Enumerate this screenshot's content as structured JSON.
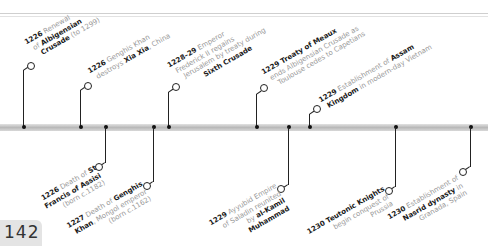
{
  "page": {
    "number": "142"
  },
  "colors": {
    "bar": "#c4c4c4",
    "connector": "#222222",
    "year_text": "#1a1a1a",
    "body_text": "#9a9a9a",
    "page_tab": "#e4e4e4"
  },
  "events_above": [
    {
      "year": "1226",
      "pre": " Renewal",
      "l2_pre": "of ",
      "bold": "Albigensian",
      "l3_bold": "Crusade",
      "l3": " (to 1299)"
    },
    {
      "year": "1226",
      "pre": " Genghis Khan",
      "l2_pre": "destroys ",
      "bold": "Xia Xia",
      "l2_post": ", China"
    },
    {
      "year": "1228–29",
      "pre": " Emperor",
      "l2": "Frederick II regains",
      "l3": "Jerusalem by treaty during",
      "l4_bold": "Sixth Crusade"
    },
    {
      "year": "1229",
      "bold": " Treaty of Meaux",
      "l2": "ends Albigensian Crusade as",
      "l3": "Toulouse cedes to Capetians"
    },
    {
      "year": "1229",
      "pre": " Establishment of ",
      "bold": "Assam",
      "l2_bold": "Kingdom",
      "l2": " in modern-day Vietnam"
    }
  ],
  "events_below": [
    {
      "year": "1226",
      "pre": " Death of ",
      "bold": "St",
      "l2_bold": "Francis of Assisi",
      "l3": "(born c.1182)"
    },
    {
      "year": "1227",
      "pre": " Death of ",
      "bold": "Genghis",
      "l2_bold": "Khan",
      "l2": ", Mongol emperor",
      "l3": "(born c.1162)"
    },
    {
      "year": "1229",
      "pre": " Ayyubid Empire",
      "l2": "of Saladin reunited",
      "l3_pre": "by ",
      "l3_bold": "al-Kamil",
      "l4_bold": "Muhammad"
    },
    {
      "year": "1230",
      "bold": " Teutonic Knights",
      "l2": "begin conquest of",
      "l3": "Prussia"
    },
    {
      "year": "1230",
      "pre": " Establishment of",
      "l2_bold": "Nasrid dynasty",
      "l2": " in",
      "l3": "Granada, Spain"
    }
  ]
}
